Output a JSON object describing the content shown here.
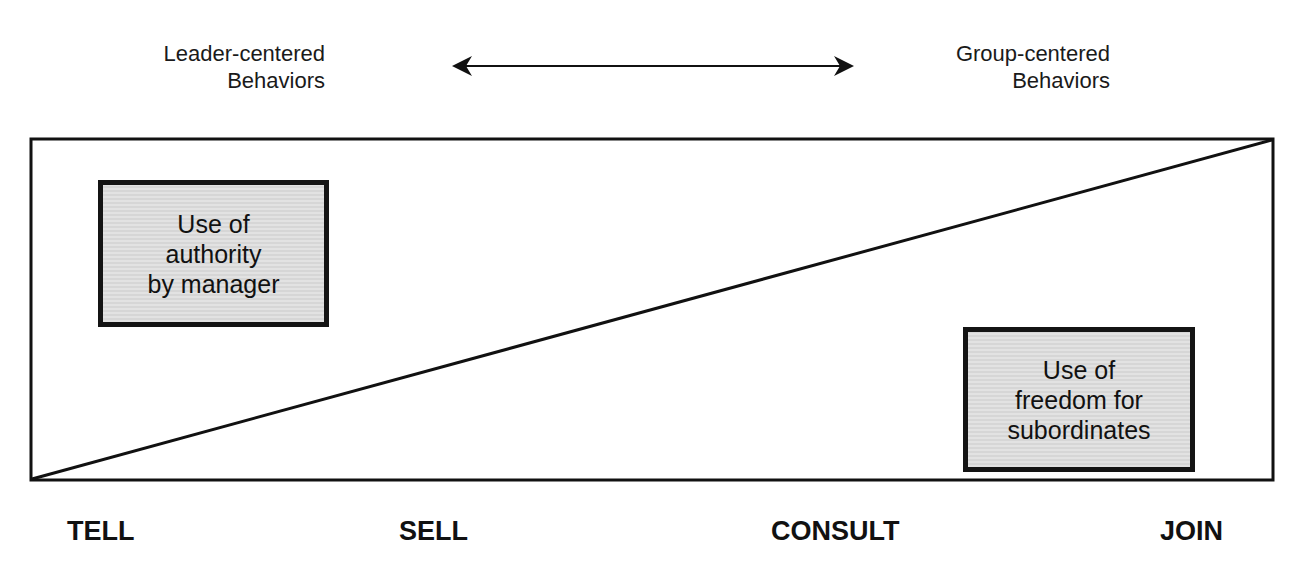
{
  "diagram": {
    "top": {
      "left_label": {
        "line1": "Leader-centered",
        "line2": "Behaviors"
      },
      "right_label": {
        "line1": "Group-centered",
        "line2": "Behaviors"
      },
      "arrow": "double-headed-arrow"
    },
    "boxes": {
      "authority": {
        "line1": "Use of",
        "line2": "authority",
        "line3": "by manager"
      },
      "freedom": {
        "line1": "Use of",
        "line2": "freedom for",
        "line3": "subordinates"
      }
    },
    "styles": [
      "TELL",
      "SELL",
      "CONSULT",
      "JOIN"
    ],
    "colors": {
      "line": "#111111",
      "box_fill": "#dcdcdc",
      "background": "#ffffff"
    }
  }
}
